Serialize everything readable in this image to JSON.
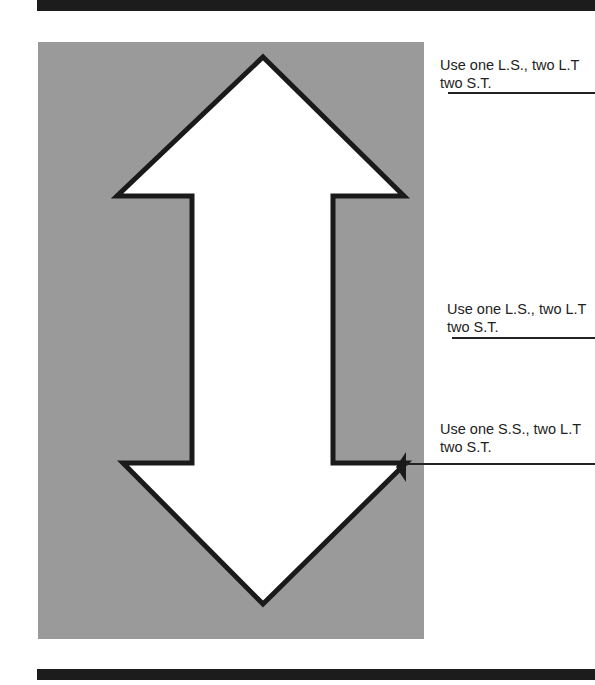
{
  "diagram": {
    "type": "double-headed vertical arrow",
    "panel_color": "#9a9a9a",
    "arrow_fill": "#ffffff",
    "outline_color": "#1a1a1a"
  },
  "annotations": [
    {
      "line1": "Use one L.S., two L.T",
      "line2": "two S.T."
    },
    {
      "line1": "Use one L.S., two L.T",
      "line2": "two S.T."
    },
    {
      "line1": "Use one S.S., two L.T",
      "line2": "two S.T."
    }
  ]
}
